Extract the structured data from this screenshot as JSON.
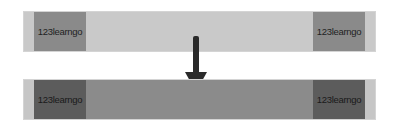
{
  "diagram": {
    "before": {
      "left_label": "123learngo",
      "right_label": "123learngo",
      "colors": {
        "outer": "#c9c9c9",
        "block": "#8a8a8a"
      }
    },
    "after": {
      "left_label": "123learngo",
      "right_label": "123learngo",
      "colors": {
        "outer": "#c6c6c6",
        "middle": "#8b8b8b",
        "block": "#5c5c5c"
      }
    },
    "arrow": {
      "icon": "arrow-down-icon",
      "color": "#2a2a2a"
    }
  }
}
